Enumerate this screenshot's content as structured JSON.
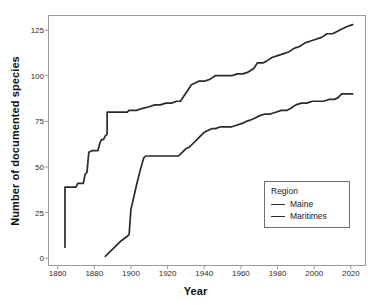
{
  "chart_data": {
    "type": "line",
    "title": "",
    "xlabel": "Year",
    "ylabel": "Number of documented species",
    "xlim": [
      1855,
      2028
    ],
    "ylim": [
      -4,
      133
    ],
    "xticks": [
      1860,
      1880,
      1900,
      1920,
      1940,
      1960,
      1980,
      2000,
      2020
    ],
    "yticks": [
      0,
      25,
      50,
      75,
      100,
      125
    ],
    "grid": false,
    "legend": {
      "title": "Region",
      "position": "inside-bottom-right",
      "entries": [
        "Maine",
        "Maritimes"
      ]
    },
    "series": [
      {
        "name": "Maine",
        "color": "#2a2a2a",
        "points": [
          [
            1864,
            6
          ],
          [
            1864,
            39
          ],
          [
            1870,
            39
          ],
          [
            1871,
            41
          ],
          [
            1874,
            41
          ],
          [
            1875,
            46
          ],
          [
            1876,
            47
          ],
          [
            1877,
            58
          ],
          [
            1879,
            59
          ],
          [
            1880,
            59
          ],
          [
            1882,
            59
          ],
          [
            1883,
            63
          ],
          [
            1884,
            65
          ],
          [
            1885,
            65
          ],
          [
            1886,
            67
          ],
          [
            1887,
            68
          ],
          [
            1887,
            80
          ],
          [
            1891,
            80
          ],
          [
            1895,
            80
          ],
          [
            1898,
            80
          ],
          [
            1899,
            81
          ],
          [
            1903,
            81
          ],
          [
            1906,
            82
          ],
          [
            1910,
            83
          ],
          [
            1913,
            84
          ],
          [
            1916,
            84
          ],
          [
            1919,
            85
          ],
          [
            1922,
            85
          ],
          [
            1925,
            86
          ],
          [
            1927,
            86
          ],
          [
            1929,
            89
          ],
          [
            1931,
            92
          ],
          [
            1933,
            95
          ],
          [
            1935,
            96
          ],
          [
            1937,
            97
          ],
          [
            1940,
            97
          ],
          [
            1943,
            98
          ],
          [
            1946,
            100
          ],
          [
            1949,
            100
          ],
          [
            1952,
            100
          ],
          [
            1955,
            100
          ],
          [
            1958,
            101
          ],
          [
            1961,
            101
          ],
          [
            1964,
            102
          ],
          [
            1967,
            104
          ],
          [
            1969,
            107
          ],
          [
            1972,
            107
          ],
          [
            1974,
            108
          ],
          [
            1977,
            110
          ],
          [
            1980,
            111
          ],
          [
            1983,
            112
          ],
          [
            1986,
            113
          ],
          [
            1989,
            115
          ],
          [
            1992,
            116
          ],
          [
            1995,
            118
          ],
          [
            1998,
            119
          ],
          [
            2001,
            120
          ],
          [
            2004,
            121
          ],
          [
            2007,
            123
          ],
          [
            2010,
            123
          ],
          [
            2012,
            124
          ],
          [
            2014,
            125
          ],
          [
            2016,
            126
          ],
          [
            2018,
            127
          ],
          [
            2021,
            128
          ]
        ]
      },
      {
        "name": "Maritimes",
        "color": "#2a2a2a",
        "points": [
          [
            1886,
            1
          ],
          [
            1890,
            5
          ],
          [
            1894,
            9
          ],
          [
            1898,
            12
          ],
          [
            1899,
            13
          ],
          [
            1900,
            27
          ],
          [
            1901,
            31
          ],
          [
            1903,
            40
          ],
          [
            1905,
            48
          ],
          [
            1907,
            55
          ],
          [
            1908,
            56
          ],
          [
            1912,
            56
          ],
          [
            1916,
            56
          ],
          [
            1920,
            56
          ],
          [
            1924,
            56
          ],
          [
            1926,
            56
          ],
          [
            1928,
            58
          ],
          [
            1930,
            60
          ],
          [
            1932,
            61
          ],
          [
            1934,
            63
          ],
          [
            1936,
            65
          ],
          [
            1938,
            67
          ],
          [
            1940,
            69
          ],
          [
            1942,
            70
          ],
          [
            1944,
            71
          ],
          [
            1946,
            71
          ],
          [
            1949,
            72
          ],
          [
            1952,
            72
          ],
          [
            1955,
            72
          ],
          [
            1958,
            73
          ],
          [
            1961,
            74
          ],
          [
            1963,
            75
          ],
          [
            1966,
            76
          ],
          [
            1968,
            77
          ],
          [
            1970,
            78
          ],
          [
            1973,
            79
          ],
          [
            1976,
            79
          ],
          [
            1979,
            80
          ],
          [
            1982,
            81
          ],
          [
            1985,
            81
          ],
          [
            1987,
            82
          ],
          [
            1990,
            84
          ],
          [
            1993,
            85
          ],
          [
            1996,
            85
          ],
          [
            1999,
            86
          ],
          [
            2002,
            86
          ],
          [
            2005,
            86
          ],
          [
            2008,
            87
          ],
          [
            2011,
            87
          ],
          [
            2013,
            88
          ],
          [
            2015,
            90
          ],
          [
            2021,
            90
          ]
        ]
      }
    ]
  },
  "axes": {
    "x_title": "Year",
    "y_title": "Number of documented species",
    "x_tick_labels": [
      "1860",
      "1880",
      "1900",
      "1920",
      "1940",
      "1960",
      "1980",
      "2000",
      "2020"
    ],
    "y_tick_labels": [
      "0",
      "25",
      "50",
      "75",
      "100",
      "125"
    ]
  },
  "legend": {
    "title": "Region",
    "items": [
      {
        "label": "Maine"
      },
      {
        "label": "Maritimes"
      }
    ]
  },
  "style": {
    "line_color": "#2a2a2a",
    "panel_border": "#9a9a9a",
    "text_color": "#1a1a1a"
  }
}
